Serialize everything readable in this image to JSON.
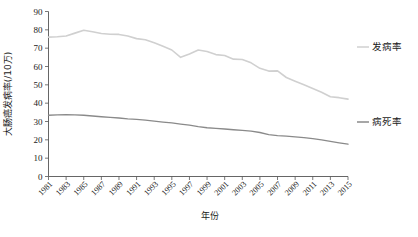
{
  "chart_data": {
    "type": "line",
    "title": "",
    "xlabel": "年份",
    "ylabel": "大肠癌发病率(/10万)",
    "xlim": [
      1981,
      2015
    ],
    "ylim": [
      0,
      90
    ],
    "ytick_step": 10,
    "xtick_step": 2,
    "grid": false,
    "legend_position": "right",
    "x": [
      1981,
      1982,
      1983,
      1984,
      1985,
      1986,
      1987,
      1988,
      1989,
      1990,
      1991,
      1992,
      1993,
      1994,
      1995,
      1996,
      1997,
      1998,
      1999,
      2000,
      2001,
      2002,
      2003,
      2004,
      2005,
      2006,
      2007,
      2008,
      2009,
      2010,
      2011,
      2012,
      2013,
      2014,
      2015
    ],
    "xtick_labels": [
      "1981",
      "1983",
      "1985",
      "1987",
      "1989",
      "1991",
      "1993",
      "1995",
      "1997",
      "1999",
      "2001",
      "2003",
      "2005",
      "2007",
      "2009",
      "2011",
      "2013",
      "2015"
    ],
    "ytick_labels": [
      "0",
      "10",
      "20",
      "30",
      "40",
      "50",
      "60",
      "70",
      "80",
      "90"
    ],
    "series": [
      {
        "name": "发病率",
        "color": "#d0d0d0",
        "width": 1.6,
        "values": [
          76.0,
          76.2,
          76.6,
          78.2,
          79.8,
          79.0,
          78.0,
          77.6,
          77.5,
          76.6,
          75.2,
          74.6,
          73.0,
          71.0,
          69.0,
          65.0,
          66.8,
          69.0,
          68.2,
          66.5,
          66.0,
          64.0,
          63.8,
          62.0,
          59.0,
          57.5,
          57.6,
          54.0,
          52.0,
          50.0,
          48.0,
          46.0,
          43.5,
          43.0,
          42.2
        ]
      },
      {
        "name": "病死率",
        "color": "#8a8a8a",
        "width": 1.3,
        "values": [
          33.4,
          33.6,
          33.7,
          33.6,
          33.4,
          33.0,
          32.6,
          32.2,
          31.9,
          31.4,
          31.2,
          30.7,
          30.2,
          29.7,
          29.2,
          28.6,
          28.0,
          27.2,
          26.6,
          26.3,
          25.9,
          25.5,
          25.2,
          24.8,
          24.0,
          22.8,
          22.3,
          22.0,
          21.6,
          21.2,
          20.6,
          20.0,
          19.2,
          18.4,
          17.6
        ]
      }
    ]
  },
  "legend": {
    "items": [
      {
        "label": "发病率"
      },
      {
        "label": "病死率"
      }
    ]
  }
}
